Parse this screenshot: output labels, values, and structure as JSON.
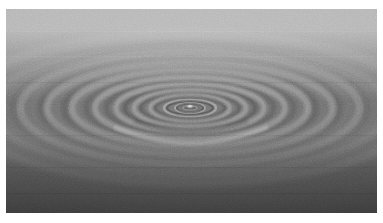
{
  "image": {
    "subject": "water-ripples",
    "title": "Concentric water ripples from a droplet impact",
    "medium": "photograph",
    "color_mode": "grayscale",
    "width_px": 383,
    "height_px": 223,
    "border": {
      "style": "white-paper-margin",
      "color": "#ffffff",
      "left_px": 6,
      "top_px": 9,
      "right_px": 6,
      "bottom_px": 10
    },
    "plate": {
      "x_px": 6,
      "y_px": 9,
      "width_px": 371,
      "height_px": 204
    },
    "lighting": {
      "gradient": "vertical",
      "top_color": "#b6b6b6",
      "upper_mid_color": "#939393",
      "mid_color": "#6e6e6e",
      "lower_mid_color": "#505050",
      "bottom_color": "#3c3c3c"
    },
    "grain": {
      "present": true,
      "description": "fine film grain / sensor noise",
      "opacity": 0.3
    }
  },
  "scene": {
    "center": {
      "x_px": 190,
      "y_px": 108
    },
    "droplet_highlight": {
      "present": true,
      "x_px": 190,
      "y_px": 106,
      "radius_px": 3,
      "color": "#d8d8d8"
    },
    "perspective": {
      "view": "oblique-low-angle",
      "ring_aspect_ratio": 3.05,
      "note": "circular surface waves project as nested ellipses"
    },
    "wave_crest_color": "#cfcfcf",
    "wave_trough_color": "#4a4a4a"
  },
  "chart_data": {
    "type": "line",
    "xlabel": "Radius from impact point (px)",
    "ylabel": "Relative crest brightness",
    "x": [
      7,
      15,
      26,
      40,
      56,
      74,
      95,
      118,
      143,
      170,
      199,
      230
    ],
    "values": [
      0.96,
      0.88,
      0.92,
      0.85,
      0.78,
      0.72,
      0.66,
      0.6,
      0.54,
      0.47,
      0.4,
      0.33
    ],
    "ylim": [
      0,
      1
    ],
    "grid": false,
    "legend": "none",
    "rings": [
      {
        "index": 1,
        "radius_x_px": 7,
        "radius_y_px": 2,
        "crest_opacity": 0.5,
        "trough_opacity": 0.42
      },
      {
        "index": 2,
        "radius_x_px": 15,
        "radius_y_px": 5,
        "crest_opacity": 0.44,
        "trough_opacity": 0.38
      },
      {
        "index": 3,
        "radius_x_px": 26,
        "radius_y_px": 8,
        "crest_opacity": 0.46,
        "trough_opacity": 0.4
      },
      {
        "index": 4,
        "radius_x_px": 40,
        "radius_y_px": 13,
        "crest_opacity": 0.42,
        "trough_opacity": 0.36
      },
      {
        "index": 5,
        "radius_x_px": 56,
        "radius_y_px": 18,
        "crest_opacity": 0.39,
        "trough_opacity": 0.33
      },
      {
        "index": 6,
        "radius_x_px": 74,
        "radius_y_px": 24,
        "crest_opacity": 0.36,
        "trough_opacity": 0.3
      },
      {
        "index": 7,
        "radius_x_px": 95,
        "radius_y_px": 31,
        "crest_opacity": 0.33,
        "trough_opacity": 0.27
      },
      {
        "index": 8,
        "radius_x_px": 118,
        "radius_y_px": 39,
        "crest_opacity": 0.3,
        "trough_opacity": 0.25
      },
      {
        "index": 9,
        "radius_x_px": 143,
        "radius_y_px": 47,
        "crest_opacity": 0.27,
        "trough_opacity": 0.22
      },
      {
        "index": 10,
        "radius_x_px": 170,
        "radius_y_px": 56,
        "crest_opacity": 0.24,
        "trough_opacity": 0.19
      },
      {
        "index": 11,
        "radius_x_px": 199,
        "radius_y_px": 65,
        "crest_opacity": 0.2,
        "trough_opacity": 0.16
      },
      {
        "index": 12,
        "radius_x_px": 230,
        "radius_y_px": 75,
        "crest_opacity": 0.16,
        "trough_opacity": 0.13
      }
    ]
  }
}
